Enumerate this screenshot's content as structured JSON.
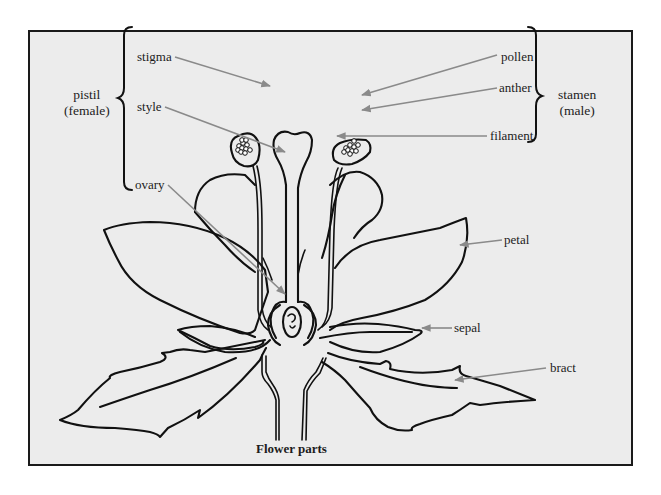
{
  "diagram": {
    "title": "Flower parts",
    "groups": {
      "pistil": {
        "line1": "pistil",
        "line2": "(female)",
        "parts": [
          "stigma",
          "style",
          "ovary"
        ]
      },
      "stamen": {
        "line1": "stamen",
        "line2": "(male)",
        "parts": [
          "pollen",
          "anther",
          "filament"
        ]
      }
    },
    "labels": {
      "stigma": "stigma",
      "style": "style",
      "ovary": "ovary",
      "pollen": "pollen",
      "anther": "anther",
      "filament": "filament",
      "petal": "petal",
      "sepal": "sepal",
      "bract": "bract"
    },
    "colors": {
      "background": "#ececec",
      "frame": "#1a1a1a",
      "ink": "#111111",
      "leader_line": "#8a8a8a"
    }
  }
}
